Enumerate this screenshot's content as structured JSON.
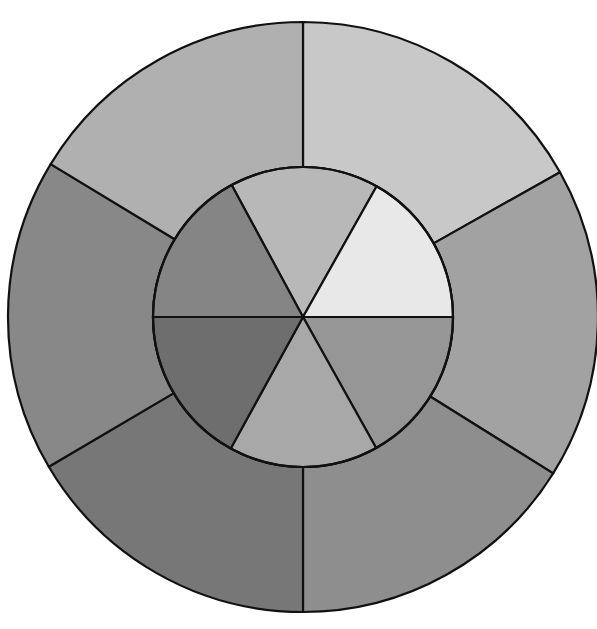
{
  "figure": {
    "name": "nested-pie-sunburst",
    "background_color": "#ffffff",
    "stroke_color": "#111111",
    "stroke_width": 2.2,
    "center_x": 303,
    "center_y": 317,
    "canvas_width": 597,
    "canvas_height": 629
  },
  "chart_data": {
    "type": "pie",
    "title": "",
    "subtitle": "",
    "xlabel": "",
    "ylabel": "",
    "grid": false,
    "legend_position": "none",
    "variant": "nested-pie",
    "annotations": [],
    "rings": [
      {
        "name": "outer-ring",
        "inner_radius": 150,
        "outer_radius": 295,
        "start_angle_deg": 0,
        "direction": "clockwise",
        "slices": [
          {
            "label": "Outer A",
            "value": 16.8,
            "start_deg": 0.0,
            "end_deg": 60.6,
            "sweep_deg": 60.6,
            "color": "#c8c8c8"
          },
          {
            "label": "Outer B",
            "value": 17.1,
            "start_deg": 60.6,
            "end_deg": 122.0,
            "sweep_deg": 61.4,
            "color": "#a2a2a2"
          },
          {
            "label": "Outer C",
            "value": 16.1,
            "start_deg": 122.0,
            "end_deg": 180.0,
            "sweep_deg": 58.0,
            "color": "#8e8e8e"
          },
          {
            "label": "Outer D",
            "value": 16.5,
            "start_deg": 180.0,
            "end_deg": 239.5,
            "sweep_deg": 59.5,
            "color": "#777777"
          },
          {
            "label": "Outer E",
            "value": 17.1,
            "start_deg": 239.5,
            "end_deg": 301.2,
            "sweep_deg": 61.7,
            "color": "#888888"
          },
          {
            "label": "Outer F",
            "value": 16.3,
            "start_deg": 301.2,
            "end_deg": 360.0,
            "sweep_deg": 58.8,
            "color": "#b0b0b0"
          }
        ]
      },
      {
        "name": "inner-ring",
        "inner_radius": 0,
        "outer_radius": 150,
        "start_angle_deg": 331.6,
        "direction": "clockwise",
        "slices": [
          {
            "label": "Inner A",
            "value": 16.1,
            "start_deg": 331.6,
            "end_deg": 389.4,
            "sweep_deg": 57.8,
            "color": "#b8b8b8"
          },
          {
            "label": "Inner B",
            "value": 16.8,
            "start_deg": 29.4,
            "end_deg": 90.0,
            "sweep_deg": 60.6,
            "color": "#e8e8e8"
          },
          {
            "label": "Inner C",
            "value": 16.9,
            "start_deg": 90.0,
            "end_deg": 150.8,
            "sweep_deg": 60.8,
            "color": "#969696"
          },
          {
            "label": "Inner D",
            "value": 16.1,
            "start_deg": 150.8,
            "end_deg": 208.8,
            "sweep_deg": 58.0,
            "color": "#a8a8a8"
          },
          {
            "label": "Inner E",
            "value": 17.0,
            "start_deg": 208.8,
            "end_deg": 270.0,
            "sweep_deg": 61.2,
            "color": "#6e6e6e"
          },
          {
            "label": "Inner F",
            "value": 17.1,
            "start_deg": 270.0,
            "end_deg": 331.6,
            "sweep_deg": 61.6,
            "color": "#858585"
          }
        ]
      }
    ]
  }
}
